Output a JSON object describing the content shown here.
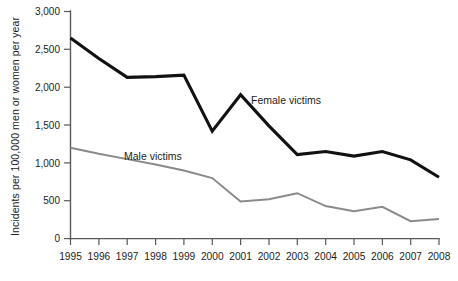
{
  "chart_data": {
    "type": "line",
    "title": "",
    "subtitle": "",
    "xlabel": "",
    "ylabel": "Incidents per 100,000 men or women per year",
    "categories": [
      "1995",
      "1996",
      "1997",
      "1998",
      "1999",
      "2000",
      "2001",
      "2002",
      "2003",
      "2004",
      "2005",
      "2006",
      "2007",
      "2008"
    ],
    "x": [
      1995,
      1996,
      1997,
      1998,
      1999,
      2000,
      2001,
      2002,
      2003,
      2004,
      2005,
      2006,
      2007,
      2008
    ],
    "xlim": [
      1995,
      2008
    ],
    "ylim": [
      0,
      3000
    ],
    "yticks": [
      0,
      500,
      1000,
      1500,
      2000,
      2500,
      3000
    ],
    "ytick_labels": [
      "0",
      "500",
      "1,000",
      "1,500",
      "2,000",
      "2,500",
      "3,000"
    ],
    "grid": false,
    "legend": "inline-annotations",
    "series": [
      {
        "name": "Female victims",
        "color": "#111111",
        "label_position": "above-line-near-2002",
        "values": [
          2650,
          2380,
          2130,
          2140,
          2160,
          1420,
          1900,
          1490,
          1110,
          1150,
          1090,
          1150,
          1040,
          810
        ]
      },
      {
        "name": "Male victims",
        "color": "#8a8a8a",
        "label_position": "above-line-near-1998",
        "values": [
          1200,
          1120,
          1050,
          980,
          900,
          800,
          490,
          520,
          600,
          430,
          360,
          420,
          230,
          260
        ]
      }
    ],
    "annotations": [
      {
        "text": "Female victims",
        "x": 2002,
        "y": 1900
      },
      {
        "text": "Male victims",
        "x": 1998,
        "y": 1080
      }
    ]
  },
  "axis": {
    "y_title": "Incidents per 100,000 men or women per year",
    "y_labels": [
      "3,000",
      "2,500",
      "2,000",
      "1,500",
      "1,000",
      "500",
      "0"
    ],
    "x_labels": [
      "1995",
      "1996",
      "1997",
      "1998",
      "1999",
      "2000",
      "2001",
      "2002",
      "2003",
      "2004",
      "2005",
      "2006",
      "2007",
      "2008"
    ]
  },
  "annotations": {
    "female_label": "Female victims",
    "male_label": "Male victims"
  },
  "colors": {
    "female_line": "#111111",
    "male_line": "#8a8a8a",
    "axis": "#58585a",
    "text": "#1c1c1c",
    "background": "#ffffff"
  },
  "caption": {
    "clipped_text": ""
  }
}
